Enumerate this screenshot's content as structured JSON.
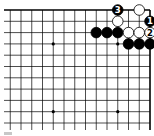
{
  "diagram": {
    "type": "go-board-fragment",
    "visible_corner": "top-right",
    "colors": {
      "black": "#000000",
      "white": "#ffffff",
      "line": "#000000"
    },
    "star_points": [
      {
        "row": 3,
        "col_from_right": 3
      },
      {
        "row": 3,
        "col_from_right": 9
      },
      {
        "row": 9,
        "col_from_right": 3
      },
      {
        "row": 9,
        "col_from_right": 9
      }
    ],
    "stones": [
      {
        "color": "black",
        "row": 0,
        "col_from_right": 3,
        "label": "3"
      },
      {
        "color": "white",
        "row": 0,
        "col_from_right": 1,
        "label": ""
      },
      {
        "color": "white",
        "row": 1,
        "col_from_right": 3,
        "label": ""
      },
      {
        "color": "black",
        "row": 1,
        "col_from_right": 0,
        "label": "1"
      },
      {
        "color": "black",
        "row": 2,
        "col_from_right": 5,
        "label": ""
      },
      {
        "color": "black",
        "row": 2,
        "col_from_right": 4,
        "label": ""
      },
      {
        "color": "black",
        "row": 2,
        "col_from_right": 3,
        "label": ""
      },
      {
        "color": "white",
        "row": 2,
        "col_from_right": 2,
        "label": ""
      },
      {
        "color": "white",
        "row": 2,
        "col_from_right": 1,
        "label": ""
      },
      {
        "color": "white",
        "row": 2,
        "col_from_right": 0,
        "label": "2"
      },
      {
        "color": "black",
        "row": 3,
        "col_from_right": 2,
        "label": ""
      },
      {
        "color": "black",
        "row": 3,
        "col_from_right": 1,
        "label": ""
      },
      {
        "color": "black",
        "row": 3,
        "col_from_right": 0,
        "label": ""
      }
    ]
  }
}
